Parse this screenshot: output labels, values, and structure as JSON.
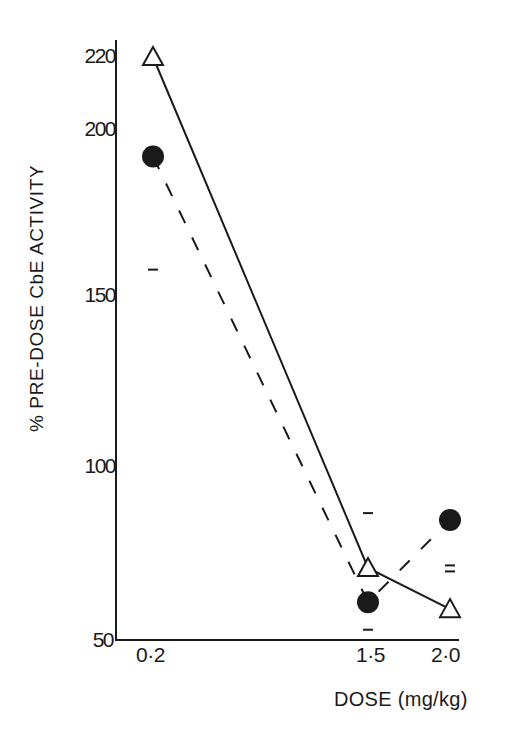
{
  "chart_data": {
    "type": "line",
    "title": "",
    "xlabel": "DOSE (mg/kg)",
    "ylabel": "% PRE-DOSE CbE ACTIVITY",
    "x": [
      0.2,
      1.5,
      2.0
    ],
    "x_tick_labels": [
      "0·2",
      "1·5",
      "2·0"
    ],
    "y_ticks": [
      50,
      100,
      150,
      200,
      220
    ],
    "y_tick_labels": [
      "50",
      "100",
      "150",
      "200",
      "220"
    ],
    "ylim": [
      50,
      222
    ],
    "xlim": [
      0.0,
      2.05
    ],
    "grid": false,
    "legend": null,
    "series": [
      {
        "name": "open triangles (solid line)",
        "marker": "open-triangle",
        "line_style": "solid",
        "values": [
          220,
          71,
          59
        ]
      },
      {
        "name": "filled circles (dashed line)",
        "marker": "filled-circle",
        "line_style": "dashed",
        "values": [
          191,
          61,
          85
        ],
        "error_bar_marks": [
          {
            "x": 0.2,
            "lower": 158
          },
          {
            "x": 1.5,
            "upper": 87,
            "lower": 53
          },
          {
            "x": 2.0,
            "lower": 70
          }
        ]
      }
    ]
  },
  "axes": {
    "xlabel": "DOSE (mg/kg)",
    "ylabel": "% PRE-DOSE CbE ACTIVITY",
    "x_ticks": [
      "0·2",
      "1·5",
      "2·0"
    ],
    "y_ticks": [
      "50",
      "100",
      "150",
      "200",
      "220"
    ]
  },
  "colors": {
    "ink": "#1a1a1a",
    "background": "#ffffff"
  }
}
